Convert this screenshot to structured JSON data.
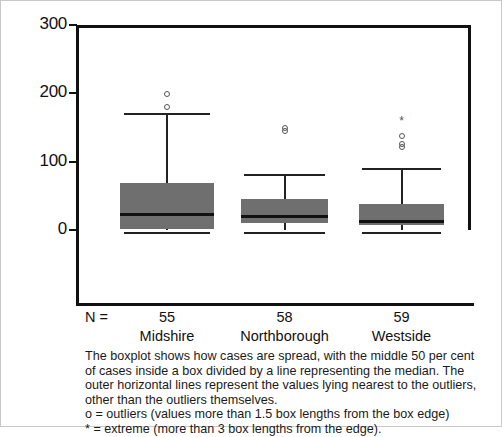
{
  "chart_data": {
    "type": "boxplot",
    "title": "",
    "xlabel": "",
    "ylabel": "Estimated months looked after",
    "ylim": [
      0,
      300
    ],
    "yticks": [
      0,
      100,
      200,
      300
    ],
    "ytick_labels": [
      "0",
      "100",
      "200",
      "300"
    ],
    "grid": false,
    "legend": "none",
    "categories": [
      "Midshire",
      "Northborough",
      "Westside"
    ],
    "n_label": "N =",
    "counts": [
      "55",
      "58",
      "59"
    ],
    "box_fill_color": "#6f6f6f",
    "line_color": "#111111",
    "series": [
      {
        "name": "Midshire",
        "n": 55,
        "whisker_low": 0,
        "q1": 2,
        "median": 24,
        "q3": 69,
        "whisker_high": 170,
        "outliers": [
          180,
          199
        ],
        "extremes": []
      },
      {
        "name": "Northborough",
        "n": 58,
        "whisker_low": 0,
        "q1": 10,
        "median": 21,
        "q3": 45,
        "whisker_high": 80,
        "outliers": [
          145,
          150
        ],
        "extremes": []
      },
      {
        "name": "Westside",
        "n": 59,
        "whisker_low": 0,
        "q1": 7,
        "median": 13,
        "q3": 38,
        "whisker_high": 90,
        "outliers": [
          122,
          126,
          138
        ],
        "extremes": [
          160
        ]
      }
    ]
  },
  "caption": {
    "lines": [
      "The boxplot shows how cases are spread, with the middle 50 per cent",
      "of cases inside a box divided by a line representing the median. The",
      "outer horizontal lines represent the values lying nearest to the outliers,",
      "other than the outliers themselves.",
      "o = outliers (values more than 1.5 box lengths from the box edge)",
      "* = extreme (more than 3 box lengths from the edge)."
    ]
  }
}
